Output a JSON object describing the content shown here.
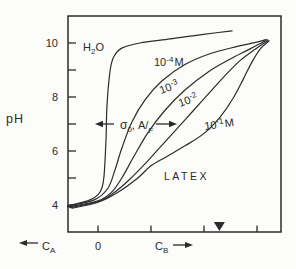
{
  "window": {
    "width": 296,
    "height": 269,
    "background": "#fcfcfa",
    "line_color": "#2b2b2b"
  },
  "chart_data": {
    "type": "line",
    "ylabel": "pH",
    "ylim": [
      3.2,
      11.0
    ],
    "grid": false,
    "legend": "inline curve labels",
    "y_axis": {
      "label": "pH",
      "ticks": [
        4,
        5,
        6,
        7,
        8,
        9,
        10
      ],
      "labeled_ticks": [
        10,
        8,
        6,
        4
      ]
    },
    "x_axis": {
      "ticks_units": [
        0,
        1,
        2,
        3
      ],
      "zero_label": "0",
      "left_label": "CA",
      "right_label": "CB",
      "left_arrow": "left",
      "right_arrow": "right",
      "marker_u": 2.29
    },
    "series": [
      {
        "id": "h2o",
        "name": "H2O",
        "points": [
          [
            -0.57,
            3.96
          ],
          [
            -0.15,
            4.19
          ],
          [
            0.04,
            4.48
          ],
          [
            0.11,
            5.0
          ],
          [
            0.15,
            6.4
          ],
          [
            0.17,
            7.7
          ],
          [
            0.23,
            9.0
          ],
          [
            0.3,
            9.5
          ],
          [
            0.45,
            9.81
          ],
          [
            0.79,
            10.0
          ],
          [
            1.36,
            10.15
          ],
          [
            1.92,
            10.3
          ],
          [
            2.53,
            10.45
          ]
        ]
      },
      {
        "id": "m4",
        "name": "10^-4 M",
        "points": [
          [
            -0.57,
            3.96
          ],
          [
            -0.06,
            4.2
          ],
          [
            0.19,
            4.63
          ],
          [
            0.32,
            5.3
          ],
          [
            0.45,
            6.1
          ],
          [
            0.64,
            7.07
          ],
          [
            0.89,
            7.9
          ],
          [
            1.21,
            8.6
          ],
          [
            1.64,
            9.2
          ],
          [
            2.11,
            9.6
          ],
          [
            2.58,
            9.85
          ],
          [
            3.02,
            10.04
          ],
          [
            3.17,
            10.13
          ]
        ]
      },
      {
        "id": "m3",
        "name": "10^-3",
        "points": [
          [
            -0.57,
            3.93
          ],
          [
            0.0,
            4.15
          ],
          [
            0.26,
            4.48
          ],
          [
            0.45,
            5.0
          ],
          [
            0.66,
            5.74
          ],
          [
            0.94,
            6.67
          ],
          [
            1.26,
            7.5
          ],
          [
            1.64,
            8.26
          ],
          [
            2.08,
            8.93
          ],
          [
            2.49,
            9.4
          ],
          [
            2.87,
            9.78
          ],
          [
            3.13,
            10.05
          ],
          [
            3.19,
            10.13
          ]
        ]
      },
      {
        "id": "m2",
        "name": "10^-2",
        "points": [
          [
            -0.53,
            3.9
          ],
          [
            0.0,
            4.12
          ],
          [
            0.3,
            4.45
          ],
          [
            0.6,
            4.95
          ],
          [
            0.9,
            5.55
          ],
          [
            1.2,
            6.2
          ],
          [
            1.5,
            6.85
          ],
          [
            1.8,
            7.5
          ],
          [
            2.1,
            8.15
          ],
          [
            2.4,
            8.8
          ],
          [
            2.68,
            9.35
          ],
          [
            2.95,
            9.75
          ],
          [
            3.21,
            10.1
          ]
        ]
      },
      {
        "id": "m1",
        "name": "10^-1 M",
        "points": [
          [
            -0.49,
            3.88
          ],
          [
            0.0,
            4.1
          ],
          [
            0.4,
            4.5
          ],
          [
            0.75,
            5.0
          ],
          [
            1.0,
            5.45
          ],
          [
            1.3,
            5.8
          ],
          [
            1.65,
            6.2
          ],
          [
            2.0,
            6.65
          ],
          [
            2.3,
            7.25
          ],
          [
            2.55,
            7.95
          ],
          [
            2.75,
            8.7
          ],
          [
            2.92,
            9.35
          ],
          [
            3.08,
            9.82
          ],
          [
            3.23,
            10.08
          ]
        ]
      }
    ],
    "curve_labels": {
      "h2o": {
        "main": "H",
        "sub": "2",
        "tail": "O"
      },
      "m4": {
        "base": "10",
        "exp": "-4",
        "tail": "M"
      },
      "m3": {
        "base": "10",
        "exp": "-3",
        "tail": ""
      },
      "m2": {
        "base": "10",
        "exp": "-2",
        "tail": ""
      },
      "m1": {
        "base": "10",
        "exp": "-1",
        "tail": "M"
      },
      "latex": "LATEX"
    },
    "annotations": {
      "sigma": {
        "sym": "σ",
        "sub": "0",
        "mid": ", A/",
        "sub2": "F",
        "full": "σ0, A/F (double arrow)"
      }
    },
    "axis_labels": {
      "ca": {
        "main": "C",
        "sub": "A"
      },
      "cb": {
        "main": "C",
        "sub": "B"
      },
      "zero": "0"
    }
  }
}
